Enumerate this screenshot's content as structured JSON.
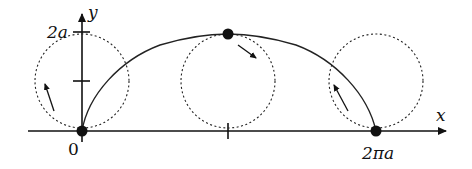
{
  "diagram": {
    "axes": {
      "x_label": "x",
      "y_label": "y"
    },
    "labels": {
      "origin": "0",
      "y_tick_top": "2a",
      "x_end": "2πa"
    },
    "circles": [
      {
        "name": "start",
        "cx": 82,
        "cy": 81,
        "r": 47
      },
      {
        "name": "middle",
        "cx": 228,
        "cy": 81,
        "r": 47
      },
      {
        "name": "end",
        "cx": 376,
        "cy": 81,
        "r": 47
      }
    ],
    "points": [
      {
        "name": "start-point",
        "x": 82,
        "y": 131
      },
      {
        "name": "top-point",
        "x": 228,
        "y": 34
      },
      {
        "name": "end-point",
        "x": 376,
        "y": 131
      }
    ],
    "colors": {
      "ink": "#111111",
      "background": "#ffffff"
    }
  }
}
